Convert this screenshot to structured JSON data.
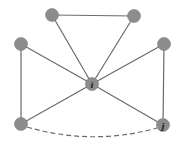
{
  "diagram": {
    "type": "graph",
    "nodes": [
      {
        "id": "top-left",
        "x": 52,
        "y": 15,
        "label": ""
      },
      {
        "id": "top-right",
        "x": 134,
        "y": 16,
        "label": ""
      },
      {
        "id": "mid-left",
        "x": 21,
        "y": 44,
        "label": ""
      },
      {
        "id": "mid-right",
        "x": 164,
        "y": 44,
        "label": ""
      },
      {
        "id": "center",
        "x": 92,
        "y": 84,
        "label": "i"
      },
      {
        "id": "bottom-left",
        "x": 21,
        "y": 124,
        "label": ""
      },
      {
        "id": "bottom-right",
        "x": 163,
        "y": 125,
        "label": "j"
      }
    ],
    "edges": [
      {
        "from": "top-left",
        "to": "top-right",
        "style": "solid"
      },
      {
        "from": "top-left",
        "to": "center",
        "style": "solid"
      },
      {
        "from": "top-right",
        "to": "center",
        "style": "solid"
      },
      {
        "from": "mid-left",
        "to": "center",
        "style": "solid"
      },
      {
        "from": "mid-right",
        "to": "center",
        "style": "solid"
      },
      {
        "from": "mid-left",
        "to": "bottom-left",
        "style": "solid"
      },
      {
        "from": "mid-right",
        "to": "bottom-right",
        "style": "solid"
      },
      {
        "from": "bottom-left",
        "to": "center",
        "style": "solid"
      },
      {
        "from": "bottom-right",
        "to": "center",
        "style": "solid"
      },
      {
        "from": "bottom-left",
        "to": "bottom-right",
        "style": "dashed-curve"
      }
    ],
    "colors": {
      "node_fill": "#8c8c8c",
      "edge": "#6a6a6a",
      "label": "#1a1a1a",
      "background": "#ffffff"
    },
    "labels": {
      "center": "i",
      "bottom_right": "j"
    }
  }
}
